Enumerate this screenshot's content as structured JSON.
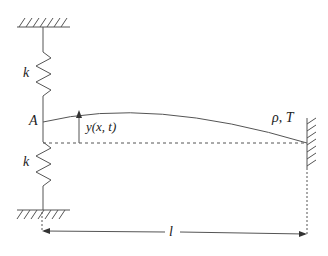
{
  "diagram": {
    "labels": {
      "spring_top": "k",
      "spring_bottom": "k",
      "point": "A",
      "displacement": "y(x, t)",
      "string_props": "ρ, T",
      "length": "l"
    },
    "stroke_color": "#555555"
  }
}
